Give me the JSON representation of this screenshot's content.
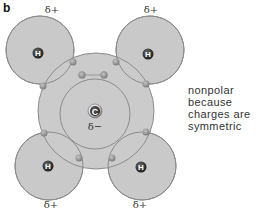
{
  "panel_label": "b",
  "molecule": "CH4",
  "atoms": {
    "carbon": {
      "symbol": "C",
      "charge": "δ−"
    },
    "hydrogens": [
      {
        "symbol": "H",
        "charge": "δ+",
        "position": "top-left"
      },
      {
        "symbol": "H",
        "charge": "δ+",
        "position": "top-right"
      },
      {
        "symbol": "H",
        "charge": "δ+",
        "position": "bottom-left"
      },
      {
        "symbol": "H",
        "charge": "δ+",
        "position": "bottom-right"
      }
    ]
  },
  "caption": {
    "lines": [
      "nonpolar",
      "because",
      "charges are",
      "symmetric"
    ]
  },
  "colors": {
    "shell_fill": "#c8c8c8",
    "shell_stroke": "#8a8a8a",
    "electron": "#9a9a9a",
    "nucleus": "#2a2a2a",
    "text": "#333333"
  }
}
